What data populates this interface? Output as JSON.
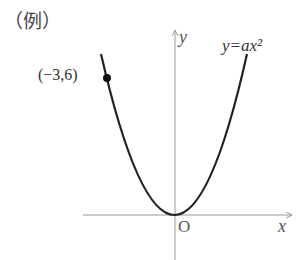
{
  "title": "（例）",
  "diagram": {
    "type": "parabola-graph",
    "equation_label": "y=ax²",
    "axis_labels": {
      "x": "x",
      "y": "y",
      "origin": "O"
    },
    "point": {
      "label": "(−3,6)",
      "x": -3,
      "y": 6
    },
    "colors": {
      "curve": "#222222",
      "axis": "#999999",
      "text": "#333333"
    }
  }
}
